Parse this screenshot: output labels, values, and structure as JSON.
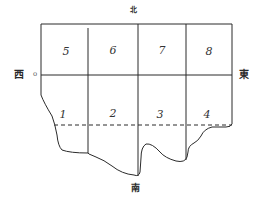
{
  "diagram": {
    "type": "land-plot-map",
    "directions": {
      "north": "北",
      "south": "南",
      "east": "東",
      "west": "西",
      "west_marker": "o"
    },
    "plots": [
      {
        "id": "1",
        "label": "1",
        "row": "south",
        "col": 1
      },
      {
        "id": "2",
        "label": "2",
        "row": "south",
        "col": 2
      },
      {
        "id": "3",
        "label": "3",
        "row": "south",
        "col": 3
      },
      {
        "id": "4",
        "label": "4",
        "row": "south",
        "col": 4
      },
      {
        "id": "5",
        "label": "5",
        "row": "north",
        "col": 1
      },
      {
        "id": "6",
        "label": "6",
        "row": "north",
        "col": 2
      },
      {
        "id": "7",
        "label": "7",
        "row": "north",
        "col": 3
      },
      {
        "id": "8",
        "label": "8",
        "row": "north",
        "col": 4
      }
    ],
    "line_color": "#2b2b2b"
  }
}
